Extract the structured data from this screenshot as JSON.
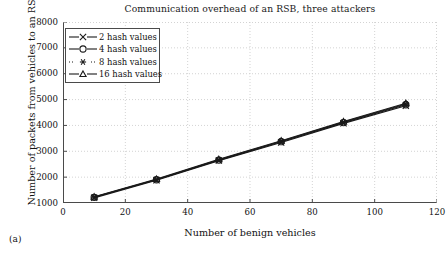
{
  "figure": {
    "subfigure_label": "(a)"
  },
  "chart_data": {
    "type": "line",
    "title": "Communication overhead of an RSB, three attackers",
    "xlabel": "Number of benign vehicles",
    "ylabel": "Number of packets from vehicles to an RSB",
    "xlim": [
      0,
      120
    ],
    "ylim": [
      1000,
      8000
    ],
    "xticks": [
      0,
      20,
      40,
      60,
      80,
      100,
      120
    ],
    "yticks": [
      1000,
      2000,
      3000,
      4000,
      5000,
      6000,
      7000,
      8000
    ],
    "grid": true,
    "legend_position": "upper-left",
    "x": [
      10,
      30,
      50,
      70,
      90,
      110
    ],
    "series": [
      {
        "name": "2 hash values",
        "marker": "x-cross",
        "values": [
          1200,
          1880,
          2640,
          3340,
          4080,
          4760
        ]
      },
      {
        "name": "4 hash values",
        "marker": "circle",
        "values": [
          1220,
          1900,
          2660,
          3370,
          4110,
          4800
        ]
      },
      {
        "name": "8 hash values",
        "marker": "asterisk",
        "values": [
          1230,
          1910,
          2670,
          3390,
          4130,
          4830
        ]
      },
      {
        "name": "16 hash values",
        "marker": "triangle",
        "values": [
          1240,
          1925,
          2690,
          3410,
          4150,
          4860
        ]
      }
    ],
    "colors": {
      "line": "#1a1a1a",
      "grid": "#c8c8c8",
      "axis": "#4a4a4a",
      "text": "#111111",
      "background": "#ffffff"
    }
  }
}
